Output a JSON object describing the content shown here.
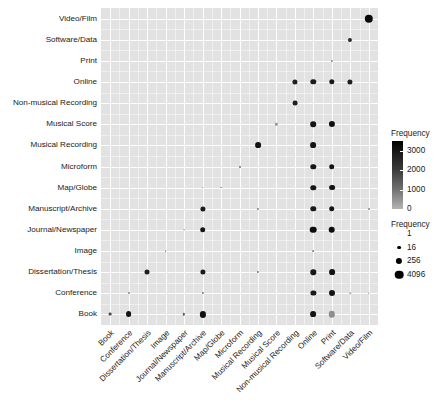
{
  "chart_data": {
    "type": "heatmap",
    "title": "",
    "xlabel": "",
    "ylabel": "",
    "grid": true,
    "legend_position": "right",
    "categories_x": [
      "Book",
      "Conference",
      "Dissertation/Thesis",
      "Image",
      "Journal/Newspaper",
      "Manuscript/Archive",
      "Map/Globe",
      "Microform",
      "Musical Recording",
      "Musical Score",
      "Non-musical Recording",
      "Online",
      "Print",
      "Software/Data",
      "Video/Film"
    ],
    "categories_y": [
      "Video/Film",
      "Software/Data",
      "Print",
      "Online",
      "Non-musical Recording",
      "Musical Score",
      "Musical Recording",
      "Microform",
      "Map/Globe",
      "Manuscript/Archive",
      "Journal/Newspaper",
      "Image",
      "Dissertation/Thesis",
      "Conference",
      "Book"
    ],
    "color_legend": {
      "title": "Frequency",
      "ticks": [
        "3000",
        "2000",
        "1000",
        "0"
      ],
      "tick_values": [
        3000,
        2000,
        1000,
        0
      ],
      "low_color": "#b4b4b4",
      "high_color": "#000000"
    },
    "size_legend": {
      "title": "Frequency",
      "labels": [
        "1",
        "16",
        "256",
        "4096"
      ],
      "values": [
        1,
        16,
        256,
        4096
      ],
      "radii_px": [
        0.6,
        1.9,
        3.1,
        4.3
      ]
    },
    "points": [
      {
        "x": "Video/Film",
        "y": "Video/Film",
        "value": 3400,
        "r": 4.2,
        "color": "#0a0a0a"
      },
      {
        "x": "Software/Data",
        "y": "Software/Data",
        "value": 900,
        "r": 2.1,
        "color": "#2a2a2a"
      },
      {
        "x": "Print",
        "y": "Print",
        "value": 120,
        "r": 1.1,
        "color": "#888888"
      },
      {
        "x": "Non-musical Recording",
        "y": "Online",
        "value": 700,
        "r": 2.6,
        "color": "#1f1f1f"
      },
      {
        "x": "Online",
        "y": "Online",
        "value": 800,
        "r": 2.7,
        "color": "#1a1a1a"
      },
      {
        "x": "Print",
        "y": "Online",
        "value": 750,
        "r": 2.7,
        "color": "#1a1a1a"
      },
      {
        "x": "Software/Data",
        "y": "Online",
        "value": 700,
        "r": 2.6,
        "color": "#1f1f1f"
      },
      {
        "x": "Non-musical Recording",
        "y": "Non-musical Recording",
        "value": 600,
        "r": 2.4,
        "color": "#1f1f1f"
      },
      {
        "x": "Musical Score",
        "y": "Musical Score",
        "value": 150,
        "r": 1.2,
        "color": "#9a9a9a"
      },
      {
        "x": "Online",
        "y": "Musical Score",
        "value": 850,
        "r": 2.8,
        "color": "#141414"
      },
      {
        "x": "Print",
        "y": "Musical Score",
        "value": 1000,
        "r": 3.1,
        "color": "#101010"
      },
      {
        "x": "Musical Recording",
        "y": "Musical Recording",
        "value": 900,
        "r": 2.9,
        "color": "#141414"
      },
      {
        "x": "Online",
        "y": "Musical Recording",
        "value": 900,
        "r": 2.9,
        "color": "#141414"
      },
      {
        "x": "Microform",
        "y": "Microform",
        "value": 110,
        "r": 1.0,
        "color": "#707070"
      },
      {
        "x": "Online",
        "y": "Microform",
        "value": 800,
        "r": 2.7,
        "color": "#161616"
      },
      {
        "x": "Print",
        "y": "Microform",
        "value": 850,
        "r": 2.8,
        "color": "#141414"
      },
      {
        "x": "Manuscript/Archive",
        "y": "Map/Globe",
        "value": 60,
        "r": 0.9,
        "color": "#8a8a8a"
      },
      {
        "x": "Map/Globe",
        "y": "Map/Globe",
        "value": 70,
        "r": 0.9,
        "color": "#9a9a9a"
      },
      {
        "x": "Online",
        "y": "Map/Globe",
        "value": 800,
        "r": 2.7,
        "color": "#161616"
      },
      {
        "x": "Print",
        "y": "Map/Globe",
        "value": 900,
        "r": 2.9,
        "color": "#141414"
      },
      {
        "x": "Manuscript/Archive",
        "y": "Manuscript/Archive",
        "value": 700,
        "r": 2.6,
        "color": "#1a1a1a"
      },
      {
        "x": "Musical Recording",
        "y": "Manuscript/Archive",
        "value": 120,
        "r": 1.1,
        "color": "#7a7a7a"
      },
      {
        "x": "Online",
        "y": "Manuscript/Archive",
        "value": 750,
        "r": 2.7,
        "color": "#181818"
      },
      {
        "x": "Print",
        "y": "Manuscript/Archive",
        "value": 800,
        "r": 2.8,
        "color": "#141414"
      },
      {
        "x": "Video/Film",
        "y": "Manuscript/Archive",
        "value": 90,
        "r": 1.0,
        "color": "#8a8a8a"
      },
      {
        "x": "Journal/Newspaper",
        "y": "Journal/Newspaper",
        "value": 55,
        "r": 0.8,
        "color": "#9a9a9a"
      },
      {
        "x": "Manuscript/Archive",
        "y": "Journal/Newspaper",
        "value": 800,
        "r": 2.8,
        "color": "#141414"
      },
      {
        "x": "Online",
        "y": "Journal/Newspaper",
        "value": 1100,
        "r": 3.3,
        "color": "#0d0d0d"
      },
      {
        "x": "Print",
        "y": "Journal/Newspaper",
        "value": 1100,
        "r": 3.3,
        "color": "#0d0d0d"
      },
      {
        "x": "Image",
        "y": "Image",
        "value": 45,
        "r": 0.8,
        "color": "#8a8a8a"
      },
      {
        "x": "Online",
        "y": "Image",
        "value": 60,
        "r": 0.9,
        "color": "#8a8a8a"
      },
      {
        "x": "Dissertation/Thesis",
        "y": "Dissertation/Thesis",
        "value": 650,
        "r": 2.5,
        "color": "#1f1f1f"
      },
      {
        "x": "Manuscript/Archive",
        "y": "Dissertation/Thesis",
        "value": 700,
        "r": 2.6,
        "color": "#1a1a1a"
      },
      {
        "x": "Musical Recording",
        "y": "Dissertation/Thesis",
        "value": 130,
        "r": 1.1,
        "color": "#7a7a7a"
      },
      {
        "x": "Online",
        "y": "Dissertation/Thesis",
        "value": 750,
        "r": 2.7,
        "color": "#181818"
      },
      {
        "x": "Print",
        "y": "Dissertation/Thesis",
        "value": 900,
        "r": 2.9,
        "color": "#141414"
      },
      {
        "x": "Conference",
        "y": "Conference",
        "value": 80,
        "r": 1.0,
        "color": "#8a8a8a"
      },
      {
        "x": "Manuscript/Archive",
        "y": "Conference",
        "value": 130,
        "r": 1.1,
        "color": "#7a7a7a"
      },
      {
        "x": "Online",
        "y": "Conference",
        "value": 700,
        "r": 2.6,
        "color": "#1a1a1a"
      },
      {
        "x": "Print",
        "y": "Conference",
        "value": 950,
        "r": 3.0,
        "color": "#121212"
      },
      {
        "x": "Software/Data",
        "y": "Conference",
        "value": 40,
        "r": 0.7,
        "color": "#a8a8a8"
      },
      {
        "x": "Video/Film",
        "y": "Conference",
        "value": 40,
        "r": 0.7,
        "color": "#a8a8a8"
      },
      {
        "x": "Book",
        "y": "Book",
        "value": 200,
        "r": 1.4,
        "color": "#4a4a4a"
      },
      {
        "x": "Conference",
        "y": "Book",
        "value": 900,
        "r": 2.9,
        "color": "#141414"
      },
      {
        "x": "Journal/Newspaper",
        "y": "Book",
        "value": 150,
        "r": 1.2,
        "color": "#5a5a5a"
      },
      {
        "x": "Manuscript/Archive",
        "y": "Book",
        "value": 1000,
        "r": 3.1,
        "color": "#101010"
      },
      {
        "x": "Online",
        "y": "Book",
        "value": 900,
        "r": 2.9,
        "color": "#141414"
      },
      {
        "x": "Print",
        "y": "Book",
        "value": 2600,
        "r": 3.2,
        "color": "#8e8e8e"
      }
    ]
  }
}
